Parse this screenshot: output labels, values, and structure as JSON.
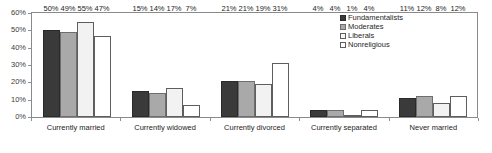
{
  "chart_data": {
    "type": "bar",
    "title": "",
    "xlabel": "",
    "ylabel": "",
    "ylim": [
      0,
      60
    ],
    "ytick_labels": [
      "60%",
      "50%",
      "40%",
      "30%",
      "20%",
      "10%",
      "0%"
    ],
    "ytick_values": [
      60,
      50,
      40,
      30,
      20,
      10,
      0
    ],
    "grid": false,
    "legend_position": "top-right-inside",
    "categories": [
      "Currently married",
      "Currently widowed",
      "Currently divorced",
      "Currently separated",
      "Never married"
    ],
    "series": [
      {
        "name": "Fundamentalists",
        "color": "#3a3a3a",
        "values": [
          50,
          15,
          21,
          4,
          11
        ],
        "labels": [
          "50%",
          "15%",
          "21%",
          "4%",
          "11%"
        ]
      },
      {
        "name": "Moderates",
        "color": "#a9a9a9",
        "values": [
          49,
          14,
          21,
          4,
          12
        ],
        "labels": [
          "49%",
          "14%",
          "21%",
          "4%",
          "12%"
        ]
      },
      {
        "name": "Liberals",
        "color": "#f2f2f2",
        "values": [
          55,
          17,
          19,
          1,
          8
        ],
        "labels": [
          "55%",
          "17%",
          "19%",
          "1%",
          "8%"
        ]
      },
      {
        "name": "Nonreligious",
        "color": "#ffffff",
        "values": [
          47,
          7,
          31,
          4,
          12
        ],
        "labels": [
          "47%",
          "7%",
          "31%",
          "4%",
          "12%"
        ]
      }
    ]
  }
}
